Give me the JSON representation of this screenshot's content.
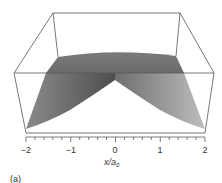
{
  "figure": {
    "panel_label": "(a)",
    "xlabel_main": "x/a",
    "xlabel_sub": "0"
  },
  "chart_data": {
    "type": "area",
    "subtype": "3d-surface",
    "title": "",
    "xlabel": "x/a0",
    "ylabel": "",
    "zlabel": "",
    "xlim": [
      -2,
      2
    ],
    "x_ticks": [
      -2,
      -1,
      0,
      1,
      2
    ],
    "x_tick_labels": [
      "−2",
      "−1",
      "0",
      "1",
      "2"
    ],
    "minor_tick_step": 0.2,
    "grid": false,
    "legend": null,
    "surface_function": "exp(-|x|/a0)",
    "profile": {
      "x": [
        -2,
        -1.5,
        -1,
        -0.5,
        0,
        0.5,
        1,
        1.5,
        2
      ],
      "values": [
        0.135,
        0.223,
        0.368,
        0.607,
        1.0,
        0.607,
        0.368,
        0.223,
        0.135
      ]
    },
    "annotations": [
      "(a)"
    ]
  },
  "colors": {
    "box_line": "#555555",
    "surface_dark": "#6a6a6a",
    "surface_light": "#b5b5b5",
    "text": "#333333"
  }
}
